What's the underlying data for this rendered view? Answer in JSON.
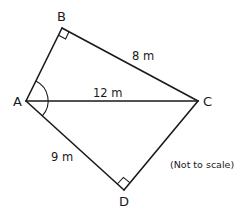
{
  "diagram": {
    "type": "geometry",
    "vertices": {
      "A": {
        "label": "A",
        "x": 26,
        "y": 101
      },
      "B": {
        "label": "B",
        "x": 62,
        "y": 28
      },
      "C": {
        "label": "C",
        "x": 198,
        "y": 101
      },
      "D": {
        "label": "D",
        "x": 124,
        "y": 190
      }
    },
    "segments": [
      {
        "from": "A",
        "to": "B",
        "label": ""
      },
      {
        "from": "B",
        "to": "C",
        "label": "8 m"
      },
      {
        "from": "A",
        "to": "C",
        "label": "12 m"
      },
      {
        "from": "A",
        "to": "D",
        "label": "9 m"
      },
      {
        "from": "D",
        "to": "C",
        "label": ""
      }
    ],
    "right_angles": [
      "B",
      "D"
    ],
    "angle_marked": "A",
    "labels": {
      "bc": "8 m",
      "ac": "12 m",
      "ad": "9 m"
    },
    "note": "(Not to scale)",
    "stroke_color": "#1a1a1a"
  }
}
